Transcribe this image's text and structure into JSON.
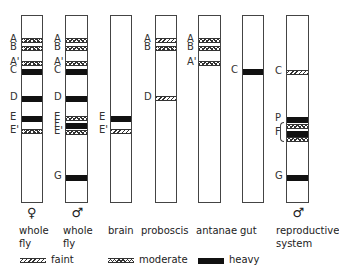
{
  "columns": [
    {
      "label_line1": "whole",
      "label_line2": "fly",
      "sex": "♀",
      "x": 21,
      "w": 22,
      "bands": [
        {
          "id": "A",
          "label": "A",
          "y": 37,
          "type": "moderate"
        },
        {
          "id": "B",
          "label": "B",
          "y": 45,
          "type": "moderate"
        },
        {
          "id": "A'",
          "label": "A'",
          "y": 60,
          "type": "moderate"
        },
        {
          "id": "C",
          "label": "C",
          "y": 68,
          "type": "heavy"
        },
        {
          "id": "D",
          "label": "D",
          "y": 95,
          "type": "heavy"
        },
        {
          "id": "E",
          "label": "E",
          "y": 115,
          "type": "heavy"
        },
        {
          "id": "E'",
          "label": "E'",
          "y": 128,
          "type": "moderate"
        }
      ]
    },
    {
      "label_line1": "whole",
      "label_line2": "fly",
      "sex": "♂",
      "x": 65,
      "w": 23,
      "bands": [
        {
          "id": "A",
          "label": "A",
          "y": 37,
          "type": "moderate"
        },
        {
          "id": "B",
          "label": "B",
          "y": 45,
          "type": "moderate"
        },
        {
          "id": "A'",
          "label": "A'",
          "y": 60,
          "type": "moderate"
        },
        {
          "id": "C",
          "label": "C",
          "y": 68,
          "type": "heavy"
        },
        {
          "id": "D",
          "label": "D",
          "y": 95,
          "type": "heavy"
        },
        {
          "id": "E",
          "label": "E",
          "y": 115,
          "type": "moderate"
        },
        {
          "id": "F",
          "label": "F",
          "y": 122,
          "type": "heavy"
        },
        {
          "id": "E'",
          "label": "E'",
          "y": 129,
          "type": "moderate"
        },
        {
          "id": "G",
          "label": "G",
          "y": 174,
          "type": "heavy"
        }
      ]
    },
    {
      "label_line1": "brain",
      "label_line2": "",
      "sex": "",
      "x": 110,
      "w": 22,
      "bands": [
        {
          "id": "E",
          "label": "E",
          "y": 115,
          "type": "heavy"
        },
        {
          "id": "E'",
          "label": "E'",
          "y": 128,
          "type": "faint"
        }
      ]
    },
    {
      "label_line1": "proboscis",
      "label_line2": "",
      "sex": "",
      "x": 155,
      "w": 22,
      "bands": [
        {
          "id": "A",
          "label": "A",
          "y": 37,
          "type": "faint"
        },
        {
          "id": "B",
          "label": "B",
          "y": 45,
          "type": "moderate"
        },
        {
          "id": "D",
          "label": "D",
          "y": 95,
          "type": "faint"
        }
      ]
    },
    {
      "label_line1": "antanae",
      "label_line2": "",
      "sex": "",
      "x": 198,
      "w": 23,
      "bands": [
        {
          "id": "A",
          "label": "A",
          "y": 37,
          "type": "moderate"
        },
        {
          "id": "B",
          "label": "B",
          "y": 45,
          "type": "moderate"
        },
        {
          "id": "A'",
          "label": "A'",
          "y": 60,
          "type": "moderate"
        }
      ]
    },
    {
      "label_line1": "gut",
      "label_line2": "",
      "sex": "",
      "x": 242,
      "w": 22,
      "bands": [
        {
          "id": "C",
          "label": "C",
          "y": 68,
          "type": "heavy"
        }
      ]
    },
    {
      "label_line1": "reproductive",
      "label_line2": "system",
      "sex": "♂",
      "x": 286,
      "w": 23,
      "bands": [
        {
          "id": "C",
          "label": "C",
          "y": 69,
          "type": "faint"
        },
        {
          "id": "P",
          "label": "P",
          "y": 116,
          "type": "heavy"
        },
        {
          "id": "F1",
          "label": "",
          "y": 123,
          "type": "moderate"
        },
        {
          "id": "F2",
          "label": "F",
          "y": 130,
          "type": "heavy"
        },
        {
          "id": "F3",
          "label": "",
          "y": 136,
          "type": "moderate"
        },
        {
          "id": "G",
          "label": "G",
          "y": 174,
          "type": "heavy"
        }
      ]
    }
  ],
  "legend": [
    {
      "type": "faint",
      "label": "faint",
      "x": 20
    },
    {
      "type": "moderate",
      "label": "moderate",
      "x": 108
    },
    {
      "type": "heavy",
      "label": "heavy",
      "x": 198
    }
  ]
}
